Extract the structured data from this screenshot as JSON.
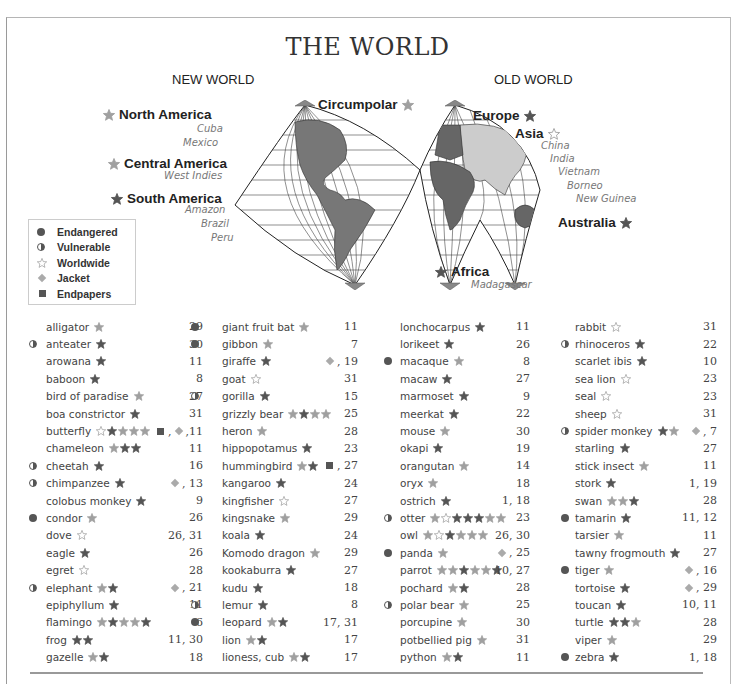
{
  "title": "THE WORLD",
  "hemispheres": {
    "new": "NEW WORLD",
    "old": "OLD WORLD"
  },
  "regions": [
    {
      "label": "North America",
      "star": "l",
      "star_side": "left",
      "x": 103,
      "y": 107
    },
    {
      "label": "Central America",
      "star": "l",
      "star_side": "left",
      "x": 108,
      "y": 156
    },
    {
      "label": "South America",
      "star": "d",
      "star_side": "left",
      "x": 111,
      "y": 191
    },
    {
      "label": "Circumpolar",
      "star": "l",
      "star_side": "right",
      "x": 318,
      "y": 97
    },
    {
      "label": "Europe",
      "star": "d",
      "star_side": "right",
      "x": 473,
      "y": 108
    },
    {
      "label": "Asia",
      "star": "o",
      "star_side": "right",
      "x": 515,
      "y": 126
    },
    {
      "label": "Australia",
      "star": "d",
      "star_side": "right",
      "x": 558,
      "y": 215
    },
    {
      "label": "Africa",
      "star": "d",
      "star_side": "left",
      "x": 435,
      "y": 264
    }
  ],
  "places": [
    {
      "label": "Cuba",
      "x": 197,
      "y": 123
    },
    {
      "label": "Mexico",
      "x": 183,
      "y": 137
    },
    {
      "label": "West Indies",
      "x": 164,
      "y": 170
    },
    {
      "label": "Amazon",
      "x": 185,
      "y": 204
    },
    {
      "label": "Brazil",
      "x": 201,
      "y": 218
    },
    {
      "label": "Peru",
      "x": 211,
      "y": 232
    },
    {
      "label": "China",
      "x": 541,
      "y": 140
    },
    {
      "label": "India",
      "x": 550,
      "y": 153
    },
    {
      "label": "Vietnam",
      "x": 558,
      "y": 166
    },
    {
      "label": "Borneo",
      "x": 567,
      "y": 180
    },
    {
      "label": "New Guinea",
      "x": 576,
      "y": 193
    },
    {
      "label": "Madagascar",
      "x": 471,
      "y": 279
    }
  ],
  "legend": [
    {
      "symbol": "dot",
      "label": "Endangered"
    },
    {
      "symbol": "half",
      "label": "Vulnerable"
    },
    {
      "symbol": "star-outline",
      "label": "Worldwide"
    },
    {
      "symbol": "diamond",
      "label": "Jacket"
    },
    {
      "symbol": "square",
      "label": "Endpapers"
    }
  ],
  "star_key": {
    "o": "outline (Worldwide)",
    "l": "light filled",
    "d": "dark filled"
  },
  "colors": {
    "text": "#333333",
    "dark_star": "#555555",
    "light_star": "#9a9a9a",
    "land_dark": "#666666",
    "land_light": "#cccccc",
    "jacket": "#aaaaaa"
  },
  "index": {
    "columns": [
      [
        {
          "name": "alligator",
          "status": "",
          "stars": "l",
          "pages": "29",
          "extra": ""
        },
        {
          "name": "anteater",
          "status": "vulnerable",
          "stars": "d",
          "pages": "30",
          "extra": ""
        },
        {
          "name": "arowana",
          "status": "",
          "stars": "d",
          "pages": "11",
          "extra": ""
        },
        {
          "name": "baboon",
          "status": "",
          "stars": "d",
          "pages": "8",
          "extra": ""
        },
        {
          "name": "bird of paradise",
          "status": "",
          "stars": "l",
          "pages": "27",
          "extra": ""
        },
        {
          "name": "boa constrictor",
          "status": "",
          "stars": "d",
          "pages": "31",
          "extra": ""
        },
        {
          "name": "butterfly",
          "status": "",
          "stars": "odlll",
          "pages": ",11",
          "extra": "square,diamond"
        },
        {
          "name": "chameleon",
          "status": "",
          "stars": "ldd",
          "pages": "11",
          "extra": ""
        },
        {
          "name": "cheetah",
          "status": "vulnerable",
          "stars": "d",
          "pages": "16",
          "extra": ""
        },
        {
          "name": "chimpanzee",
          "status": "vulnerable",
          "stars": "d",
          "pages": ", 13",
          "extra": "diamond"
        },
        {
          "name": "colobus monkey",
          "status": "",
          "stars": "d",
          "pages": "9",
          "extra": ""
        },
        {
          "name": "condor",
          "status": "endangered",
          "stars": "l",
          "pages": "26",
          "extra": ""
        },
        {
          "name": "dove",
          "status": "",
          "stars": "o",
          "pages": "26, 31",
          "extra": ""
        },
        {
          "name": "eagle",
          "status": "",
          "stars": "d",
          "pages": "26",
          "extra": ""
        },
        {
          "name": "egret",
          "status": "",
          "stars": "o",
          "pages": "28",
          "extra": ""
        },
        {
          "name": "elephant",
          "status": "vulnerable",
          "stars": "ld",
          "pages": ", 21",
          "extra": "diamond"
        },
        {
          "name": "epiphyllum",
          "status": "",
          "stars": "d",
          "pages": "11",
          "extra": ""
        },
        {
          "name": "flamingo",
          "status": "",
          "stars": "ldlld",
          "pages": "6",
          "extra": ""
        },
        {
          "name": "frog",
          "status": "",
          "stars": "dd",
          "pages": "11, 30",
          "extra": ""
        },
        {
          "name": "gazelle",
          "status": "",
          "stars": "ld",
          "pages": "18",
          "extra": ""
        }
      ],
      [
        {
          "name": "giant fruit bat",
          "status": "endangered",
          "stars": "l",
          "pages": "11",
          "extra": ""
        },
        {
          "name": "gibbon",
          "status": "endangered",
          "stars": "l",
          "pages": "7",
          "extra": ""
        },
        {
          "name": "giraffe",
          "status": "",
          "stars": "d",
          "pages": ", 19",
          "extra": "diamond"
        },
        {
          "name": "goat",
          "status": "",
          "stars": "o",
          "pages": "31",
          "extra": ""
        },
        {
          "name": "gorilla",
          "status": "vulnerable",
          "stars": "d",
          "pages": "15",
          "extra": ""
        },
        {
          "name": "grizzly bear",
          "status": "",
          "stars": "ldll",
          "pages": "25",
          "extra": ""
        },
        {
          "name": "heron",
          "status": "",
          "stars": "l",
          "pages": "28",
          "extra": ""
        },
        {
          "name": "hippopotamus",
          "status": "",
          "stars": "d",
          "pages": "23",
          "extra": ""
        },
        {
          "name": "hummingbird",
          "status": "",
          "stars": "ld",
          "pages": ", 27",
          "extra": "square"
        },
        {
          "name": "kangaroo",
          "status": "",
          "stars": "d",
          "pages": "24",
          "extra": ""
        },
        {
          "name": "kingfisher",
          "status": "",
          "stars": "o",
          "pages": "27",
          "extra": ""
        },
        {
          "name": "kingsnake",
          "status": "",
          "stars": "l",
          "pages": "29",
          "extra": ""
        },
        {
          "name": "koala",
          "status": "",
          "stars": "d",
          "pages": "24",
          "extra": ""
        },
        {
          "name": "Komodo dragon",
          "status": "",
          "stars": "l",
          "pages": "29",
          "extra": ""
        },
        {
          "name": "kookaburra",
          "status": "",
          "stars": "d",
          "pages": "27",
          "extra": ""
        },
        {
          "name": "kudu",
          "status": "",
          "stars": "d",
          "pages": "18",
          "extra": ""
        },
        {
          "name": "lemur",
          "status": "vulnerable",
          "stars": "d",
          "pages": "8",
          "extra": ""
        },
        {
          "name": "leopard",
          "status": "endangered",
          "stars": "ld",
          "pages": "17, 31",
          "extra": ""
        },
        {
          "name": "lion",
          "status": "",
          "stars": "ld",
          "pages": "17",
          "extra": ""
        },
        {
          "name": "lioness, cub",
          "status": "",
          "stars": "ld",
          "pages": "17",
          "extra": ""
        }
      ],
      [
        {
          "name": "lonchocarpus",
          "status": "",
          "stars": "d",
          "pages": "11",
          "extra": ""
        },
        {
          "name": "lorikeet",
          "status": "",
          "stars": "d",
          "pages": "26",
          "extra": ""
        },
        {
          "name": "macaque",
          "status": "endangered",
          "stars": "l",
          "pages": "8",
          "extra": ""
        },
        {
          "name": "macaw",
          "status": "",
          "stars": "d",
          "pages": "27",
          "extra": ""
        },
        {
          "name": "marmoset",
          "status": "",
          "stars": "d",
          "pages": "9",
          "extra": ""
        },
        {
          "name": "meerkat",
          "status": "",
          "stars": "d",
          "pages": "22",
          "extra": ""
        },
        {
          "name": "mouse",
          "status": "",
          "stars": "l",
          "pages": "30",
          "extra": ""
        },
        {
          "name": "okapi",
          "status": "",
          "stars": "d",
          "pages": "19",
          "extra": ""
        },
        {
          "name": "orangutan",
          "status": "",
          "stars": "l",
          "pages": "14",
          "extra": ""
        },
        {
          "name": "oryx",
          "status": "",
          "stars": "l",
          "pages": "18",
          "extra": ""
        },
        {
          "name": "ostrich",
          "status": "",
          "stars": "d",
          "pages": "1, 18",
          "extra": ""
        },
        {
          "name": "otter",
          "status": "vulnerable",
          "stars": "lodddll",
          "pages": "23",
          "extra": ""
        },
        {
          "name": "owl",
          "status": "",
          "stars": "lodlll",
          "pages": "26, 30",
          "extra": ""
        },
        {
          "name": "panda",
          "status": "endangered",
          "stars": "l",
          "pages": ", 25",
          "extra": "diamond"
        },
        {
          "name": "parrot",
          "status": "",
          "stars": "lldlld",
          "pages": "10, 27",
          "extra": ""
        },
        {
          "name": "pochard",
          "status": "",
          "stars": "ld",
          "pages": "28",
          "extra": ""
        },
        {
          "name": "polar bear",
          "status": "vulnerable",
          "stars": "l",
          "pages": "25",
          "extra": ""
        },
        {
          "name": "porcupine",
          "status": "",
          "stars": "l",
          "pages": "30",
          "extra": ""
        },
        {
          "name": "potbellied pig",
          "status": "",
          "stars": "l",
          "pages": "31",
          "extra": ""
        },
        {
          "name": "python",
          "status": "",
          "stars": "ld",
          "pages": "11",
          "extra": ""
        }
      ],
      [
        {
          "name": "rabbit",
          "status": "",
          "stars": "o",
          "pages": "31",
          "extra": ""
        },
        {
          "name": "rhinoceros",
          "status": "vulnerable",
          "stars": "d",
          "pages": "22",
          "extra": ""
        },
        {
          "name": "scarlet ibis",
          "status": "",
          "stars": "d",
          "pages": "10",
          "extra": ""
        },
        {
          "name": "sea lion",
          "status": "",
          "stars": "o",
          "pages": "23",
          "extra": ""
        },
        {
          "name": "seal",
          "status": "",
          "stars": "o",
          "pages": "23",
          "extra": ""
        },
        {
          "name": "sheep",
          "status": "",
          "stars": "o",
          "pages": "31",
          "extra": ""
        },
        {
          "name": "spider monkey",
          "status": "vulnerable",
          "stars": "dl",
          "pages": ", 7",
          "extra": "diamond"
        },
        {
          "name": "starling",
          "status": "",
          "stars": "d",
          "pages": "27",
          "extra": ""
        },
        {
          "name": "stick insect",
          "status": "",
          "stars": "l",
          "pages": "11",
          "extra": ""
        },
        {
          "name": "stork",
          "status": "",
          "stars": "d",
          "pages": "1, 19",
          "extra": ""
        },
        {
          "name": "swan",
          "status": "",
          "stars": "lld",
          "pages": "28",
          "extra": ""
        },
        {
          "name": "tamarin",
          "status": "endangered",
          "stars": "d",
          "pages": "11, 12",
          "extra": ""
        },
        {
          "name": "tarsier",
          "status": "",
          "stars": "l",
          "pages": "11",
          "extra": ""
        },
        {
          "name": "tawny frogmouth",
          "status": "",
          "stars": "d",
          "pages": "27",
          "extra": ""
        },
        {
          "name": "tiger",
          "status": "endangered",
          "stars": "l",
          "pages": ", 16",
          "extra": "diamond"
        },
        {
          "name": "tortoise",
          "status": "",
          "stars": "d",
          "pages": ", 29",
          "extra": "diamond"
        },
        {
          "name": "toucan",
          "status": "",
          "stars": "d",
          "pages": "10, 11",
          "extra": ""
        },
        {
          "name": "turtle",
          "status": "",
          "stars": "ddl",
          "pages": "28",
          "extra": ""
        },
        {
          "name": "viper",
          "status": "",
          "stars": "l",
          "pages": "29",
          "extra": ""
        },
        {
          "name": "zebra",
          "status": "endangered",
          "stars": "d",
          "pages": "1, 18",
          "extra": ""
        }
      ]
    ]
  }
}
